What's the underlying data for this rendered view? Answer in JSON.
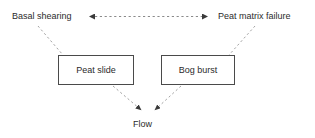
{
  "figure": {
    "type": "flow-diagram",
    "background_color": "#ffffff",
    "line_color": "#8a8a8a",
    "box_border_color": "#4a4a4a",
    "text_color": "#2b2b2b"
  },
  "labels": {
    "basal_shearing": "Basal shearing",
    "peat_matrix_failure": "Peat matrix failure",
    "flow": "Flow"
  },
  "boxes": [
    {
      "id": "peat-slide",
      "label": "Peat slide",
      "x": 58,
      "y": 55,
      "width": 76,
      "height": 30
    },
    {
      "id": "bog-burst",
      "label": "Bog burst",
      "x": 161,
      "y": 55,
      "width": 74,
      "height": 30
    }
  ],
  "connectors": [
    {
      "id": "basal-shearing-to-peat-matrix-failure",
      "style": "dashed",
      "arrowheads": "both",
      "from": "Basal shearing",
      "to": "Peat matrix failure"
    },
    {
      "id": "basal-shearing-to-peat-slide",
      "style": "dashed",
      "arrowheads": "none",
      "from": "Basal shearing",
      "to": "Peat slide"
    },
    {
      "id": "peat-matrix-failure-to-bog-burst",
      "style": "dashed",
      "arrowheads": "none",
      "from": "Peat matrix failure",
      "to": "Bog burst"
    },
    {
      "id": "peat-slide-to-flow",
      "style": "dashed",
      "arrowheads": "end",
      "from": "Peat slide",
      "to": "Flow"
    },
    {
      "id": "bog-burst-to-flow",
      "style": "dashed",
      "arrowheads": "end",
      "from": "Bog burst",
      "to": "Flow"
    }
  ]
}
